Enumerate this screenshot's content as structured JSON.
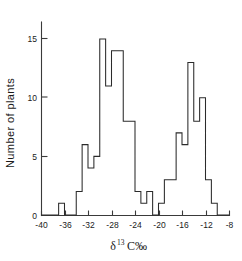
{
  "chart_data": {
    "type": "bar",
    "title": "",
    "subtitle": "",
    "xlabel": "δ¹³C‰",
    "xlabel_base": "δ",
    "xlabel_sup": "13",
    "xlabel_tail": "C‰",
    "ylabel": "Number of plants",
    "xlim": [
      -40,
      -8
    ],
    "ylim": [
      0,
      16
    ],
    "xticks": [
      -40,
      -36,
      -32,
      -28,
      -24,
      -20,
      -16,
      -12,
      -8
    ],
    "xticklabels": [
      "-40",
      "-36",
      "-32",
      "-28",
      "-24",
      "-20",
      "-16",
      "-12",
      "-8"
    ],
    "yticks": [
      0,
      5,
      10,
      15
    ],
    "yticklabels": [
      "0",
      "5",
      "10",
      "15"
    ],
    "grid": false,
    "legend": false,
    "bin_width": 1,
    "bin_starts": [
      -40,
      -39,
      -38,
      -37,
      -36,
      -35,
      -34,
      -33,
      -32,
      -31,
      -30,
      -29,
      -28,
      -27,
      -26,
      -25,
      -24,
      -23,
      -22,
      -21,
      -20,
      -19,
      -18,
      -17,
      -16,
      -15,
      -14,
      -13,
      -12,
      -11,
      -10,
      -9
    ],
    "categories": [
      "-40 to -39",
      "-39 to -38",
      "-38 to -37",
      "-37 to -36",
      "-36 to -35",
      "-35 to -34",
      "-34 to -33",
      "-33 to -32",
      "-32 to -31",
      "-31 to -30",
      "-30 to -29",
      "-29 to -28",
      "-28 to -27",
      "-27 to -26",
      "-26 to -25",
      "-25 to -24",
      "-24 to -23",
      "-23 to -22",
      "-22 to -21",
      "-21 to -20",
      "-20 to -19",
      "-19 to -18",
      "-18 to -17",
      "-17 to -16",
      "-16 to -15",
      "-15 to -14",
      "-14 to -13",
      "-13 to -12",
      "-12 to -11",
      "-11 to -10",
      "-10 to -9",
      "-9 to -8"
    ],
    "values": [
      0,
      0,
      0,
      1,
      0,
      0,
      2,
      6,
      4,
      5,
      15,
      11,
      14,
      14,
      8,
      8,
      2,
      1,
      2,
      0,
      1,
      3,
      3,
      7,
      6,
      13,
      8,
      10,
      3,
      1,
      0,
      0
    ],
    "series": [
      {
        "name": "Number of plants",
        "values": [
          0,
          0,
          0,
          1,
          0,
          0,
          2,
          6,
          4,
          5,
          15,
          11,
          14,
          14,
          8,
          8,
          2,
          1,
          2,
          0,
          1,
          3,
          3,
          7,
          6,
          13,
          8,
          10,
          3,
          1,
          0,
          0
        ]
      }
    ],
    "annotations": [],
    "colors": {
      "line": "#2b2b2b",
      "axis": "#3a3a3a",
      "background": "#ffffff",
      "text": "#1a1a1a"
    }
  },
  "figure": {
    "plot_left_px": 41,
    "plot_right_px": 229,
    "plot_baseline_px": 215,
    "unit_px_y": 11.73
  }
}
